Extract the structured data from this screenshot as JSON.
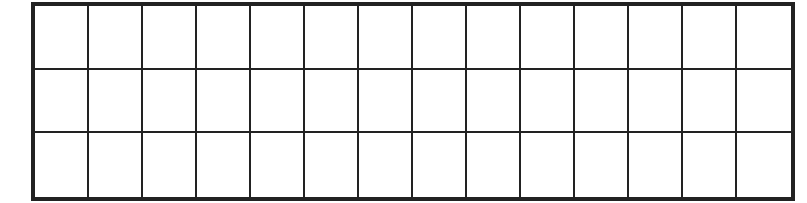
{
  "grid": {
    "rows": 3,
    "columns": 14,
    "cells": [
      [
        "",
        "",
        "",
        "",
        "",
        "",
        "",
        "",
        "",
        "",
        "",
        "",
        "",
        ""
      ],
      [
        "",
        "",
        "",
        "",
        "",
        "",
        "",
        "",
        "",
        "",
        "",
        "",
        "",
        ""
      ],
      [
        "",
        "",
        "",
        "",
        "",
        "",
        "",
        "",
        "",
        "",
        "",
        "",
        "",
        ""
      ]
    ],
    "line_color": "#222222",
    "background": "#ffffff"
  }
}
